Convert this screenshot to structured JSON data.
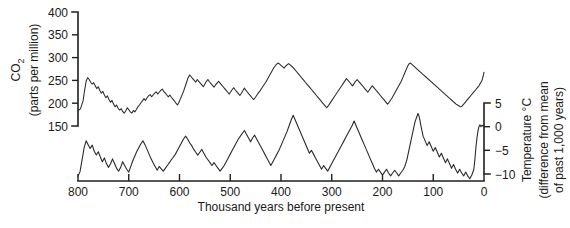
{
  "chart_data": {
    "type": "line",
    "title": "",
    "xlabel": "Thousand years before present",
    "x_ticks": [
      800,
      700,
      600,
      500,
      400,
      300,
      200,
      100,
      0
    ],
    "xlim": [
      800,
      0
    ],
    "grid": false,
    "legend": "none",
    "panels": [
      {
        "name": "co2",
        "ylabel_line1": "CO",
        "ylabel_sub": "2",
        "ylabel_line2": "(parts per million)",
        "y_ticks": [
          400,
          350,
          300,
          250,
          200,
          150
        ],
        "ylim": [
          150,
          400
        ],
        "axis_side": "left",
        "series_name": "Atmospheric CO2",
        "x": [
          800,
          795,
          790,
          787,
          784,
          781,
          778,
          775,
          772,
          769,
          766,
          763,
          760,
          757,
          754,
          751,
          748,
          745,
          742,
          739,
          736,
          733,
          730,
          727,
          724,
          721,
          718,
          715,
          712,
          709,
          706,
          703,
          700,
          697,
          694,
          691,
          688,
          685,
          682,
          679,
          676,
          673,
          670,
          667,
          664,
          661,
          658,
          655,
          652,
          649,
          646,
          643,
          640,
          637,
          634,
          631,
          628,
          625,
          622,
          619,
          616,
          613,
          610,
          607,
          604,
          601,
          598,
          595,
          592,
          589,
          586,
          583,
          580,
          577,
          574,
          571,
          568,
          565,
          562,
          559,
          556,
          553,
          550,
          547,
          544,
          541,
          538,
          535,
          532,
          529,
          526,
          523,
          520,
          517,
          514,
          511,
          508,
          505,
          502,
          499,
          496,
          493,
          490,
          487,
          484,
          481,
          478,
          475,
          472,
          469,
          466,
          463,
          460,
          457,
          454,
          451,
          448,
          445,
          442,
          439,
          436,
          433,
          430,
          427,
          424,
          421,
          418,
          415,
          412,
          409,
          406,
          403,
          400,
          397,
          394,
          391,
          388,
          385,
          382,
          379,
          376,
          373,
          370,
          367,
          364,
          361,
          358,
          355,
          352,
          349,
          346,
          343,
          340,
          337,
          334,
          331,
          328,
          325,
          322,
          319,
          316,
          313,
          310,
          307,
          304,
          301,
          298,
          295,
          292,
          289,
          286,
          283,
          280,
          277,
          274,
          271,
          268,
          265,
          262,
          259,
          256,
          253,
          250,
          247,
          244,
          241,
          238,
          235,
          232,
          229,
          226,
          223,
          220,
          217,
          214,
          211,
          208,
          205,
          202,
          199,
          196,
          193,
          190,
          187,
          184,
          181,
          178,
          175,
          172,
          169,
          166,
          163,
          160,
          157,
          154,
          151,
          148,
          145,
          142,
          139,
          136,
          133,
          130,
          127,
          124,
          121,
          118,
          115,
          112,
          109,
          106,
          103,
          100,
          97,
          94,
          91,
          88,
          85,
          82,
          79,
          76,
          73,
          70,
          67,
          64,
          61,
          58,
          55,
          52,
          49,
          46,
          43,
          40,
          37,
          34,
          31,
          28,
          25,
          22,
          19,
          16,
          13,
          10,
          8,
          6,
          4,
          3,
          2,
          1,
          0
        ],
        "y": [
          183,
          188,
          205,
          228,
          248,
          256,
          252,
          246,
          242,
          245,
          238,
          232,
          236,
          228,
          222,
          226,
          218,
          212,
          216,
          208,
          202,
          206,
          198,
          192,
          196,
          189,
          185,
          188,
          182,
          178,
          183,
          190,
          186,
          181,
          178,
          184,
          181,
          186,
          192,
          196,
          201,
          205,
          210,
          206,
          212,
          216,
          219,
          214,
          218,
          222,
          225,
          220,
          224,
          228,
          231,
          226,
          222,
          218,
          214,
          218,
          213,
          209,
          205,
          200,
          196,
          202,
          210,
          218,
          226,
          236,
          246,
          256,
          262,
          258,
          254,
          250,
          246,
          252,
          248,
          244,
          240,
          236,
          242,
          248,
          252,
          247,
          243,
          239,
          235,
          240,
          244,
          248,
          244,
          240,
          236,
          232,
          228,
          224,
          220,
          225,
          230,
          234,
          229,
          225,
          221,
          217,
          222,
          228,
          233,
          228,
          224,
          220,
          216,
          212,
          208,
          212,
          217,
          222,
          226,
          231,
          236,
          241,
          246,
          252,
          258,
          264,
          270,
          276,
          281,
          285,
          288,
          286,
          283,
          280,
          277,
          281,
          284,
          287,
          284,
          281,
          278,
          274,
          270,
          266,
          262,
          258,
          254,
          250,
          246,
          242,
          238,
          234,
          230,
          226,
          222,
          218,
          214,
          210,
          206,
          202,
          198,
          194,
          190,
          194,
          199,
          204,
          209,
          214,
          219,
          224,
          229,
          234,
          239,
          244,
          249,
          254,
          250,
          246,
          242,
          238,
          243,
          248,
          252,
          248,
          244,
          240,
          236,
          232,
          228,
          224,
          229,
          234,
          238,
          234,
          230,
          226,
          222,
          218,
          214,
          210,
          206,
          202,
          198,
          202,
          207,
          212,
          218,
          224,
          230,
          236,
          242,
          248,
          256,
          264,
          272,
          280,
          286,
          288,
          285,
          282,
          279,
          276,
          273,
          270,
          267,
          264,
          261,
          258,
          255,
          252,
          249,
          246,
          243,
          240,
          237,
          234,
          231,
          228,
          225,
          222,
          219,
          216,
          213,
          210,
          207,
          204,
          201,
          198,
          196,
          194,
          192,
          194,
          198,
          202,
          206,
          210,
          214,
          218,
          222,
          226,
          230,
          234,
          238,
          242,
          246,
          250,
          254,
          258,
          262,
          268,
          276,
          284,
          300,
          330,
          360,
          385,
          395
        ]
      },
      {
        "name": "temperature",
        "ylabel_line1": "Temperature °C",
        "ylabel_line2": "(difference from mean",
        "ylabel_line3": "of past 1,000 years)",
        "y_ticks": [
          5,
          0,
          -5,
          -10
        ],
        "ylim": [
          -12,
          6
        ],
        "axis_side": "right",
        "series_name": "Antarctic temperature anomaly",
        "x": [
          800,
          796,
          792,
          788,
          784,
          780,
          776,
          772,
          768,
          764,
          760,
          756,
          752,
          748,
          744,
          740,
          736,
          732,
          728,
          724,
          720,
          716,
          712,
          708,
          704,
          700,
          696,
          692,
          688,
          684,
          680,
          676,
          672,
          668,
          664,
          660,
          656,
          652,
          648,
          644,
          640,
          636,
          632,
          628,
          624,
          620,
          616,
          612,
          608,
          604,
          600,
          596,
          592,
          588,
          584,
          580,
          576,
          572,
          568,
          564,
          560,
          556,
          552,
          548,
          544,
          540,
          536,
          532,
          528,
          524,
          520,
          516,
          512,
          508,
          504,
          500,
          496,
          492,
          488,
          484,
          480,
          476,
          472,
          468,
          464,
          460,
          456,
          452,
          448,
          444,
          440,
          436,
          432,
          428,
          424,
          420,
          416,
          412,
          408,
          404,
          400,
          396,
          392,
          388,
          384,
          380,
          376,
          372,
          368,
          364,
          360,
          356,
          352,
          348,
          344,
          340,
          336,
          332,
          328,
          324,
          320,
          316,
          312,
          308,
          304,
          300,
          296,
          292,
          288,
          284,
          280,
          276,
          272,
          268,
          264,
          260,
          256,
          252,
          248,
          244,
          240,
          236,
          232,
          228,
          224,
          220,
          216,
          212,
          208,
          204,
          200,
          196,
          192,
          188,
          184,
          180,
          176,
          172,
          168,
          164,
          160,
          156,
          152,
          148,
          144,
          140,
          136,
          132,
          130,
          128,
          126,
          124,
          122,
          120,
          116,
          112,
          108,
          104,
          100,
          96,
          92,
          88,
          84,
          80,
          76,
          72,
          68,
          64,
          60,
          56,
          52,
          48,
          44,
          40,
          36,
          32,
          28,
          24,
          20,
          18,
          16,
          14,
          12,
          10,
          8,
          6,
          4,
          2,
          0
        ],
        "y": [
          -10.5,
          -9.5,
          -7.0,
          -4.5,
          -3.0,
          -3.8,
          -4.6,
          -3.9,
          -5.2,
          -6.0,
          -5.3,
          -6.4,
          -7.4,
          -6.6,
          -7.8,
          -8.6,
          -7.9,
          -6.8,
          -7.8,
          -8.8,
          -9.4,
          -8.6,
          -7.4,
          -8.2,
          -9.0,
          -9.6,
          -8.4,
          -7.2,
          -6.2,
          -5.2,
          -4.4,
          -3.6,
          -3.0,
          -3.8,
          -4.8,
          -5.8,
          -6.8,
          -7.6,
          -8.4,
          -9.2,
          -8.4,
          -8.9,
          -9.4,
          -8.8,
          -8.2,
          -7.6,
          -7.0,
          -6.4,
          -5.8,
          -5.0,
          -4.2,
          -3.4,
          -2.6,
          -2.0,
          -2.6,
          -3.4,
          -4.0,
          -4.8,
          -5.4,
          -6.0,
          -5.4,
          -4.8,
          -5.6,
          -6.4,
          -7.0,
          -7.6,
          -8.2,
          -7.6,
          -8.2,
          -8.8,
          -9.4,
          -8.8,
          -8.2,
          -7.4,
          -6.6,
          -5.8,
          -5.0,
          -4.2,
          -3.4,
          -2.6,
          -2.0,
          -1.4,
          -0.8,
          -1.6,
          -2.4,
          -3.2,
          -2.4,
          -1.8,
          -2.6,
          -3.4,
          -4.2,
          -5.0,
          -5.8,
          -6.6,
          -7.4,
          -8.2,
          -7.4,
          -6.6,
          -5.8,
          -5.0,
          -4.0,
          -3.0,
          -2.0,
          -1.0,
          0.2,
          1.4,
          2.4,
          1.4,
          0.4,
          -0.6,
          -1.6,
          -2.6,
          -3.6,
          -4.6,
          -5.6,
          -5.0,
          -5.8,
          -6.6,
          -7.4,
          -8.2,
          -9.0,
          -8.2,
          -8.8,
          -9.4,
          -8.6,
          -7.8,
          -7.0,
          -6.2,
          -5.4,
          -4.6,
          -3.8,
          -3.0,
          -2.2,
          -1.4,
          -0.6,
          0.2,
          1.2,
          0.2,
          -0.8,
          -1.8,
          -2.8,
          -3.8,
          -4.8,
          -5.8,
          -6.8,
          -7.8,
          -8.8,
          -9.6,
          -9.0,
          -9.6,
          -10.2,
          -9.6,
          -9.0,
          -9.8,
          -10.4,
          -9.8,
          -9.2,
          -9.8,
          -10.4,
          -9.8,
          -9.2,
          -8.4,
          -7.0,
          -5.0,
          -3.0,
          -1.0,
          1.0,
          2.2,
          2.8,
          2.2,
          1.2,
          0.0,
          -1.0,
          -2.0,
          -3.0,
          -4.0,
          -3.2,
          -4.2,
          -5.2,
          -4.4,
          -5.4,
          -6.4,
          -5.6,
          -6.6,
          -7.6,
          -6.8,
          -7.8,
          -8.8,
          -8.0,
          -9.0,
          -9.8,
          -9.0,
          -9.8,
          -10.4,
          -9.6,
          -10.4,
          -11.0,
          -10.2,
          -9.0,
          -7.0,
          -4.5,
          -2.5,
          -1.0,
          0.0,
          0.4,
          0.0,
          0.3,
          0.1,
          0.4
        ]
      }
    ]
  },
  "labels": {
    "xaxis_title": "Thousand years before present",
    "left_title_main": "CO",
    "left_title_sub": "2",
    "left_title_unit": "(parts per million)",
    "right_title_line1": "Temperature °C",
    "right_title_line2": "(difference from mean",
    "right_title_line3": "of past 1,000 years)",
    "x_tick_800": "800",
    "x_tick_700": "700",
    "x_tick_600": "600",
    "x_tick_500": "500",
    "x_tick_400": "400",
    "x_tick_300": "300",
    "x_tick_200": "200",
    "x_tick_100": "100",
    "x_tick_0": "0",
    "co2_tick_400": "400",
    "co2_tick_350": "350",
    "co2_tick_300": "300",
    "co2_tick_250": "250",
    "co2_tick_200": "200",
    "co2_tick_150": "150",
    "temp_tick_5": "5",
    "temp_tick_0": "0",
    "temp_tick_neg5": "−5",
    "temp_tick_neg10": "−10"
  },
  "colors": {
    "line": "#2a2a2a",
    "axis": "#1f1f1f",
    "text": "#1a1a1a",
    "background": "#ffffff"
  }
}
